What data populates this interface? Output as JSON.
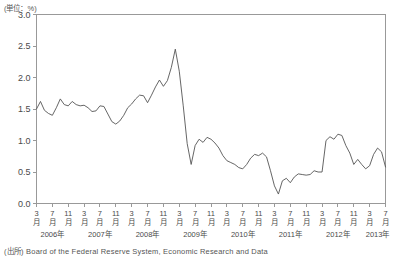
{
  "unit_label": "(単位：%)",
  "source_note": "(出所) Board of the Federal Reserve System, Economic Research and Data",
  "chart_data": {
    "type": "line",
    "title": "",
    "xlabel": "",
    "ylabel": "",
    "ylim": [
      0.0,
      3.0
    ],
    "ytick_labels": [
      "0.0",
      "0.5",
      "1.0",
      "1.5",
      "2.0",
      "2.5",
      "3.0"
    ],
    "ytick_values": [
      0.0,
      0.5,
      1.0,
      1.5,
      2.0,
      2.5,
      3.0
    ],
    "grid": false,
    "legend": "none",
    "line_color": "#555555",
    "axis_color": "#999999",
    "month_suffix": "月",
    "year_suffix": "年",
    "xtick_months": [
      "3",
      "7",
      "11",
      "3",
      "7",
      "11",
      "3",
      "7",
      "11",
      "3",
      "7",
      "11",
      "3",
      "7",
      "11",
      "3",
      "7",
      "11",
      "3",
      "7",
      "11",
      "3",
      "7"
    ],
    "xtick_positions": [
      0,
      4,
      8,
      12,
      16,
      20,
      24,
      28,
      32,
      36,
      40,
      44,
      48,
      52,
      56,
      60,
      64,
      68,
      72,
      76,
      80,
      84,
      88
    ],
    "year_labels": [
      "2006年",
      "2007年",
      "2008年",
      "2009年",
      "2010年",
      "2011年",
      "2012年",
      "2013年"
    ],
    "year_positions": [
      4,
      16,
      28,
      40,
      52,
      64,
      76,
      86
    ],
    "x_start_label": "2006年3月",
    "x_end_label": "2013年7月",
    "x": [
      0,
      1,
      2,
      3,
      4,
      5,
      6,
      7,
      8,
      9,
      10,
      11,
      12,
      13,
      14,
      15,
      16,
      17,
      18,
      19,
      20,
      21,
      22,
      23,
      24,
      25,
      26,
      27,
      28,
      29,
      30,
      31,
      32,
      33,
      34,
      35,
      36,
      37,
      38,
      39,
      40,
      41,
      42,
      43,
      44,
      45,
      46,
      47,
      48,
      49,
      50,
      51,
      52,
      53,
      54,
      55,
      56,
      57,
      58,
      59,
      60,
      61,
      62,
      63,
      64,
      65,
      66,
      67,
      68,
      69,
      70,
      71,
      72,
      73,
      74,
      75,
      76,
      77,
      78,
      79,
      80,
      81,
      82,
      83,
      84,
      85,
      86,
      87,
      88
    ],
    "values": [
      1.5,
      1.62,
      1.48,
      1.43,
      1.4,
      1.52,
      1.66,
      1.57,
      1.55,
      1.62,
      1.57,
      1.55,
      1.56,
      1.52,
      1.46,
      1.47,
      1.55,
      1.54,
      1.42,
      1.3,
      1.26,
      1.31,
      1.4,
      1.52,
      1.58,
      1.66,
      1.72,
      1.71,
      1.6,
      1.72,
      1.85,
      1.96,
      1.86,
      1.95,
      2.16,
      2.45,
      2.1,
      1.55,
      0.95,
      0.62,
      0.92,
      1.02,
      0.97,
      1.05,
      1.02,
      0.96,
      0.88,
      0.76,
      0.68,
      0.65,
      0.62,
      0.57,
      0.55,
      0.62,
      0.72,
      0.78,
      0.76,
      0.8,
      0.74,
      0.52,
      0.28,
      0.15,
      0.36,
      0.4,
      0.33,
      0.42,
      0.47,
      0.46,
      0.45,
      0.46,
      0.52,
      0.5,
      0.5,
      1.0,
      1.06,
      1.02,
      1.1,
      1.08,
      0.92,
      0.8,
      0.62,
      0.7,
      0.62,
      0.55,
      0.6,
      0.78,
      0.88,
      0.82,
      0.58
    ]
  }
}
